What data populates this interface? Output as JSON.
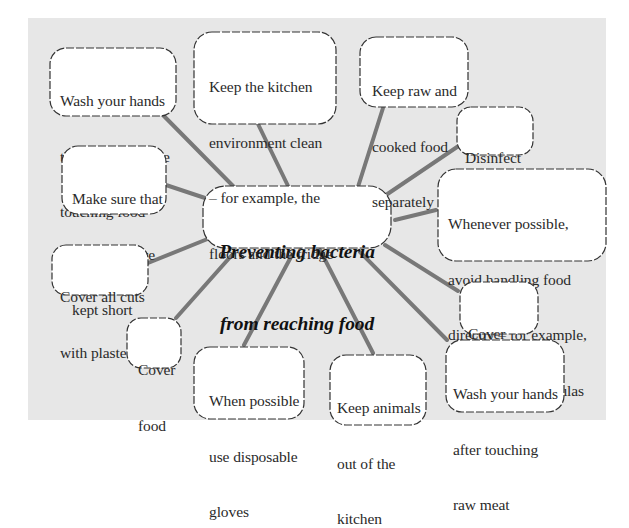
{
  "diagram": {
    "type": "mind-map",
    "colors": {
      "background": "#e7e7e7",
      "connector": "#787878",
      "cloud_fill": "#ffffff",
      "cloud_stroke": "#333333",
      "text": "#2a2a2a"
    },
    "center": {
      "label_line1": "Preventing bacteria",
      "label_line2": "from reaching food"
    },
    "nodes": [
      {
        "id": "wash-hands-before",
        "lines": [
          "Wash your hands",
          "thoroughly before",
          "touching food"
        ]
      },
      {
        "id": "kitchen-clean",
        "lines": [
          "Keep the kitchen",
          "environment clean",
          "– for example, the",
          "floors and the fridge"
        ]
      },
      {
        "id": "raw-cooked-separate",
        "lines": [
          "Keep raw and",
          "cooked food",
          "separately"
        ]
      },
      {
        "id": "disinfect-surfaces",
        "lines": [
          "Disinfect",
          "surfaces"
        ]
      },
      {
        "id": "avoid-handling",
        "lines": [
          "Whenever possible,",
          "avoid handling food",
          "directly – for example,",
          "use spoons or spatulas"
        ]
      },
      {
        "id": "nails-short",
        "lines": [
          "Make sure that",
          "your nails are",
          "kept short"
        ]
      },
      {
        "id": "cover-cuts",
        "lines": [
          "Cover all cuts",
          "with plasters"
        ]
      },
      {
        "id": "cover-hair",
        "lines": [
          "Cover",
          "your hair"
        ]
      },
      {
        "id": "cover-food",
        "lines": [
          "Cover",
          "food"
        ]
      },
      {
        "id": "disposable-gloves",
        "lines": [
          "When possible",
          "use disposable",
          "gloves"
        ]
      },
      {
        "id": "animals-out",
        "lines": [
          "Keep animals",
          "out of the",
          "kitchen"
        ]
      },
      {
        "id": "wash-hands-after-meat",
        "lines": [
          "Wash your hands",
          "after touching",
          "raw meat"
        ]
      }
    ]
  }
}
